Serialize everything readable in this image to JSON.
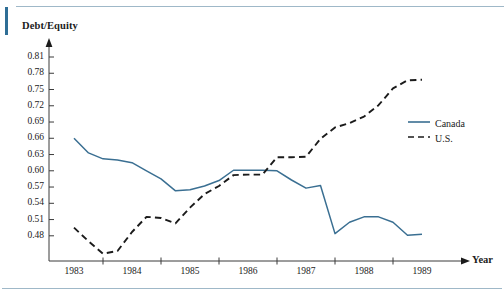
{
  "figure": {
    "accent_color": "#2e6e96",
    "rule_color": "#9fb8c8",
    "background": "#ffffff"
  },
  "chart_data": {
    "type": "line",
    "title": "",
    "subtitle": "",
    "xlabel": "Year",
    "ylabel": "Debt/Equity",
    "grid": false,
    "legend_position": "right",
    "xlim": [
      1982.75,
      1989.5
    ],
    "ylim": [
      0.445,
      0.825
    ],
    "x_tick_labels": [
      "1983",
      "1984",
      "1985",
      "1986",
      "1987",
      "1988",
      "1989"
    ],
    "x_tick_values": [
      1983,
      1984,
      1985,
      1986,
      1987,
      1988,
      1989
    ],
    "x_axis_minor_ticks": [
      1983.5,
      1984.5,
      1985.5,
      1986.5,
      1987.5,
      1988.5
    ],
    "y_tick_labels": [
      "0.81",
      "0.78",
      "0.75",
      "0.72",
      "0.69",
      "0.66",
      "0.63",
      "0.60",
      "0.57",
      "0.54",
      "0.51",
      "0.48"
    ],
    "y_tick_values": [
      0.81,
      0.78,
      0.75,
      0.72,
      0.69,
      0.66,
      0.63,
      0.6,
      0.57,
      0.54,
      0.51,
      0.48
    ],
    "series": [
      {
        "name": "Canada",
        "color": "#3a6f92",
        "style": "solid",
        "x": [
          1983.0,
          1983.25,
          1983.5,
          1983.75,
          1984.0,
          1984.25,
          1984.5,
          1984.75,
          1985.0,
          1985.25,
          1985.5,
          1985.75,
          1986.0,
          1986.25,
          1986.5,
          1986.75,
          1987.0,
          1987.25,
          1987.5,
          1987.75,
          1988.0,
          1988.25,
          1988.5,
          1988.75,
          1989.0
        ],
        "values": [
          0.66,
          0.633,
          0.622,
          0.62,
          0.615,
          0.6,
          0.585,
          0.563,
          0.565,
          0.572,
          0.582,
          0.601,
          0.601,
          0.601,
          0.6,
          0.583,
          0.568,
          0.573,
          0.484,
          0.505,
          0.515,
          0.515,
          0.505,
          0.481,
          0.483
        ]
      },
      {
        "name": "U.S.",
        "color": "#1b1b1b",
        "style": "dashed",
        "x": [
          1983.0,
          1983.25,
          1983.5,
          1983.75,
          1984.0,
          1984.25,
          1984.5,
          1984.75,
          1985.0,
          1985.25,
          1985.5,
          1985.75,
          1986.0,
          1986.25,
          1986.5,
          1986.75,
          1987.0,
          1987.25,
          1987.5,
          1987.75,
          1988.0,
          1988.25,
          1988.5,
          1988.75,
          1989.0
        ],
        "values": [
          0.495,
          0.47,
          0.447,
          0.452,
          0.487,
          0.515,
          0.513,
          0.503,
          0.532,
          0.557,
          0.572,
          0.592,
          0.593,
          0.593,
          0.625,
          0.625,
          0.626,
          0.659,
          0.68,
          0.688,
          0.7,
          0.721,
          0.752,
          0.767,
          0.768
        ]
      }
    ]
  },
  "legend": {
    "items": [
      {
        "label": "Canada",
        "color": "#3a6f92",
        "style": "solid"
      },
      {
        "label": "U.S.",
        "color": "#1b1b1b",
        "style": "dashed"
      }
    ]
  }
}
